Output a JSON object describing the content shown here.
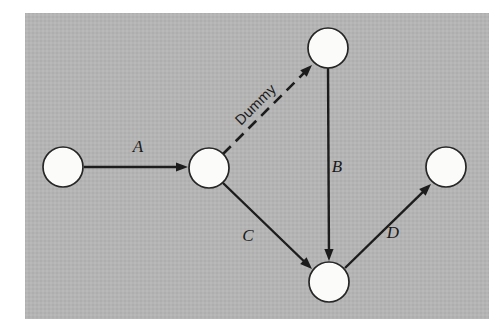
{
  "figure": {
    "background_color": "#b4b4b4",
    "page_color": "#ffffff",
    "ink_color": "#1c1c1c",
    "node_fill": "#fbfbf9",
    "panel": {
      "x": 25,
      "y": 13,
      "width": 464,
      "height": 306
    }
  },
  "nodes": [
    {
      "id": "n1",
      "name": "node-start",
      "cx": 63,
      "cy": 167,
      "r": 20,
      "label": ""
    },
    {
      "id": "n2",
      "name": "node-junction",
      "cx": 209,
      "cy": 168,
      "r": 20,
      "label": ""
    },
    {
      "id": "n3",
      "name": "node-top",
      "cx": 328,
      "cy": 48,
      "r": 20,
      "label": ""
    },
    {
      "id": "n4",
      "name": "node-bottom",
      "cx": 329,
      "cy": 282,
      "r": 20,
      "label": ""
    },
    {
      "id": "n5",
      "name": "node-end",
      "cx": 446,
      "cy": 167,
      "r": 20,
      "label": ""
    }
  ],
  "edges": [
    {
      "id": "eA",
      "name": "edge-a",
      "label": "A",
      "style": "solid",
      "from": "n1",
      "to": "n2",
      "x1": 84,
      "y1": 167,
      "x2": 188,
      "y2": 167,
      "label_x": 138,
      "label_y": 152,
      "label_rotation": 0
    },
    {
      "id": "eDummy",
      "name": "edge-dummy",
      "label": "Dummy",
      "style": "dashed",
      "from": "n2",
      "to": "n3",
      "x1": 223,
      "y1": 154,
      "x2": 312,
      "y2": 65,
      "label_x": 259,
      "label_y": 108,
      "label_rotation": -45
    },
    {
      "id": "eB",
      "name": "edge-b",
      "label": "B",
      "style": "solid",
      "from": "n3",
      "to": "n4",
      "x1": 328,
      "y1": 68,
      "x2": 329,
      "y2": 261,
      "label_x": 337,
      "label_y": 172,
      "label_rotation": 0
    },
    {
      "id": "eC",
      "name": "edge-c",
      "label": "C",
      "style": "solid",
      "from": "n2",
      "to": "n4",
      "x1": 223,
      "y1": 183,
      "x2": 312,
      "y2": 269,
      "label_x": 248,
      "label_y": 241,
      "label_rotation": 0
    },
    {
      "id": "eD",
      "name": "edge-d",
      "label": "D",
      "style": "solid",
      "from": "n4",
      "to": "n5",
      "x1": 345,
      "y1": 268,
      "x2": 431,
      "y2": 184,
      "label_x": 393,
      "label_y": 238,
      "label_rotation": 0
    }
  ],
  "legend": {
    "activity_labels": [
      "A",
      "B",
      "C",
      "D"
    ],
    "dummy_label": "Dummy"
  }
}
